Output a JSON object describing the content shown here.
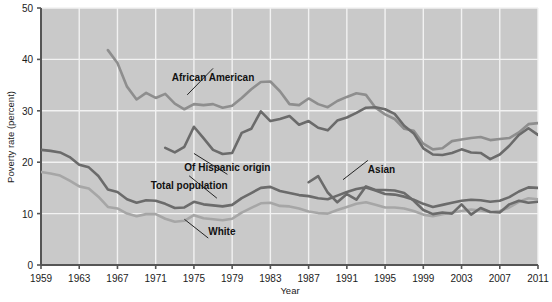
{
  "chart_data": {
    "type": "line",
    "title": "",
    "xlabel": "Year",
    "ylabel": "Poverty rate (percent)",
    "xlim": [
      1959,
      2011
    ],
    "ylim": [
      0,
      50
    ],
    "ytick_values": [
      0,
      10,
      20,
      30,
      40,
      50
    ],
    "ytick_labels": [
      "0",
      "10",
      "20",
      "30",
      "40",
      "50"
    ],
    "xtick_values": [
      1959,
      1963,
      1967,
      1971,
      1975,
      1979,
      1983,
      1987,
      1991,
      1995,
      1999,
      2003,
      2007,
      2011
    ],
    "xtick_labels": [
      "1959",
      "1963",
      "1967",
      "1971",
      "1975",
      "1979",
      "1983",
      "1987",
      "1991",
      "1995",
      "1999",
      "2003",
      "2007",
      "2011"
    ],
    "grid": true,
    "grid_color": "#f2f2f2",
    "plot_background": "#c9c9c9",
    "legend": "inline-annotations",
    "series": [
      {
        "name": "African American",
        "color": "#8e8e8e",
        "label_x": 1977,
        "label_y": 36.5,
        "x": [
          1966,
          1967,
          1968,
          1969,
          1970,
          1971,
          1972,
          1973,
          1974,
          1975,
          1976,
          1977,
          1978,
          1979,
          1980,
          1981,
          1982,
          1983,
          1984,
          1985,
          1986,
          1987,
          1988,
          1989,
          1990,
          1991,
          1992,
          1993,
          1994,
          1995,
          1996,
          1997,
          1998,
          1999,
          2000,
          2001,
          2002,
          2003,
          2004,
          2005,
          2006,
          2007,
          2008,
          2009,
          2010,
          2011
        ],
        "y": [
          41.8,
          39.3,
          34.7,
          32.2,
          33.5,
          32.5,
          33.3,
          31.4,
          30.3,
          31.3,
          31.1,
          31.3,
          30.6,
          31.0,
          32.5,
          34.2,
          35.6,
          35.7,
          33.8,
          31.3,
          31.1,
          32.4,
          31.3,
          30.7,
          31.9,
          32.7,
          33.4,
          33.1,
          30.6,
          29.3,
          28.4,
          26.5,
          26.1,
          23.6,
          22.5,
          22.7,
          24.1,
          24.4,
          24.7,
          24.9,
          24.3,
          24.5,
          24.7,
          25.8,
          27.4,
          27.6
        ]
      },
      {
        "name": "Of Hispanic origin",
        "color": "#6b6b6b",
        "label_x": 1978,
        "label_y": 19.0,
        "x": [
          1972,
          1973,
          1974,
          1975,
          1976,
          1977,
          1978,
          1979,
          1980,
          1981,
          1982,
          1983,
          1984,
          1985,
          1986,
          1987,
          1988,
          1989,
          1990,
          1991,
          1992,
          1993,
          1994,
          1995,
          1996,
          1997,
          1998,
          1999,
          2000,
          2001,
          2002,
          2003,
          2004,
          2005,
          2006,
          2007,
          2008,
          2009,
          2010,
          2011
        ],
        "y": [
          22.8,
          21.9,
          23.0,
          26.9,
          24.7,
          22.4,
          21.6,
          21.8,
          25.7,
          26.5,
          29.9,
          28.0,
          28.4,
          29.0,
          27.3,
          28.0,
          26.7,
          26.2,
          28.1,
          28.7,
          29.6,
          30.6,
          30.7,
          30.3,
          29.4,
          27.1,
          25.6,
          22.7,
          21.5,
          21.4,
          21.8,
          22.5,
          21.9,
          21.8,
          20.6,
          21.5,
          23.2,
          25.3,
          26.6,
          25.3
        ]
      },
      {
        "name": "Total population",
        "color": "#6b6b6b",
        "label_x": 1974,
        "label_y": 15.6,
        "x": [
          1959,
          1960,
          1961,
          1962,
          1963,
          1964,
          1965,
          1966,
          1967,
          1968,
          1969,
          1970,
          1971,
          1972,
          1973,
          1974,
          1975,
          1976,
          1977,
          1978,
          1979,
          1980,
          1981,
          1982,
          1983,
          1984,
          1985,
          1986,
          1987,
          1988,
          1989,
          1990,
          1991,
          1992,
          1993,
          1994,
          1995,
          1996,
          1997,
          1998,
          1999,
          2000,
          2001,
          2002,
          2003,
          2004,
          2005,
          2006,
          2007,
          2008,
          2009,
          2010,
          2011
        ],
        "y": [
          22.4,
          22.2,
          21.9,
          21.0,
          19.5,
          19.0,
          17.3,
          14.7,
          14.2,
          12.8,
          12.1,
          12.6,
          12.5,
          11.9,
          11.1,
          11.2,
          12.3,
          11.8,
          11.6,
          11.4,
          11.7,
          13.0,
          14.0,
          15.0,
          15.2,
          14.4,
          14.0,
          13.6,
          13.4,
          13.0,
          12.8,
          13.5,
          14.2,
          14.8,
          15.1,
          14.5,
          13.8,
          13.7,
          13.3,
          12.7,
          11.9,
          11.3,
          11.7,
          12.1,
          12.5,
          12.7,
          12.6,
          12.3,
          12.5,
          13.2,
          14.3,
          15.1,
          15.0
        ]
      },
      {
        "name": "White",
        "color": "#a6a6a6",
        "label_x": 1976,
        "label_y": 6.8,
        "x": [
          1959,
          1960,
          1961,
          1962,
          1963,
          1964,
          1965,
          1966,
          1967,
          1968,
          1969,
          1970,
          1971,
          1972,
          1973,
          1974,
          1975,
          1976,
          1977,
          1978,
          1979,
          1980,
          1981,
          1982,
          1983,
          1984,
          1985,
          1986,
          1987,
          1988,
          1989,
          1990,
          1991,
          1992,
          1993,
          1994,
          1995,
          1996,
          1997,
          1998,
          1999,
          2000,
          2001,
          2002,
          2003,
          2004,
          2005,
          2006,
          2007,
          2008,
          2009,
          2010,
          2011
        ],
        "y": [
          18.1,
          17.8,
          17.4,
          16.4,
          15.3,
          14.9,
          13.3,
          11.3,
          11.0,
          10.0,
          9.5,
          9.9,
          9.9,
          9.0,
          8.4,
          8.6,
          9.7,
          9.1,
          8.9,
          8.7,
          9.0,
          10.2,
          11.1,
          12.0,
          12.1,
          11.5,
          11.4,
          11.0,
          10.4,
          10.1,
          10.0,
          10.7,
          11.3,
          11.9,
          12.2,
          11.7,
          11.2,
          11.2,
          11.0,
          10.5,
          9.8,
          9.5,
          9.9,
          10.2,
          10.5,
          10.8,
          10.6,
          10.3,
          10.5,
          11.2,
          12.3,
          13.0,
          12.8
        ]
      },
      {
        "name": "Asian",
        "color": "#6b6b6b",
        "label_x": 1993,
        "label_y": 18.6,
        "x": [
          1987,
          1988,
          1989,
          1990,
          1991,
          1992,
          1993,
          1994,
          1995,
          1996,
          1997,
          1998,
          1999,
          2000,
          2001,
          2002,
          2003,
          2004,
          2005,
          2006,
          2007,
          2008,
          2009,
          2010,
          2011
        ],
        "y": [
          16.1,
          17.3,
          14.1,
          12.2,
          13.8,
          12.7,
          15.3,
          14.6,
          14.6,
          14.5,
          14.0,
          12.5,
          10.7,
          9.9,
          10.2,
          10.0,
          11.8,
          9.8,
          11.1,
          10.3,
          10.2,
          11.8,
          12.5,
          12.1,
          12.3
        ]
      }
    ]
  },
  "axes": {
    "ylabel": "Poverty rate (percent)",
    "xlabel": "Year"
  }
}
